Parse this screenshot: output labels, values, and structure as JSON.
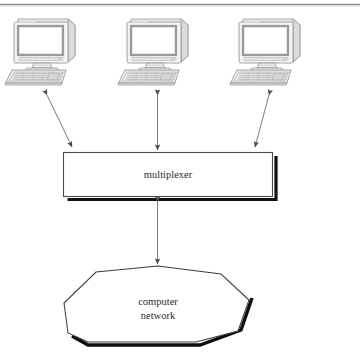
{
  "figure": {
    "type": "network-topology-diagram",
    "title": "",
    "top_rule": true,
    "background_color": "#ffffff",
    "line_color": "#3a3a3a",
    "shadow_color": "#000000",
    "text_color": "#2b2b2b",
    "device_fill": "#ffffff",
    "device_shade": "#d8d8d8"
  },
  "nodes": {
    "terminals": [
      {
        "id": "terminal-1",
        "label": "",
        "icon": "desktop-computer-icon",
        "x": 45,
        "y": 55
      },
      {
        "id": "terminal-2",
        "label": "",
        "icon": "desktop-computer-icon",
        "x": 158,
        "y": 55
      },
      {
        "id": "terminal-3",
        "label": "",
        "icon": "desktop-computer-icon",
        "x": 270,
        "y": 55
      }
    ],
    "multiplexer": {
      "id": "multiplexer-box",
      "label": "multiplexer",
      "shape": "rectangle",
      "shadow": true
    },
    "network": {
      "id": "network-cloud",
      "label_line1": "computer",
      "label_line2": "network",
      "shape": "octagon",
      "shadow": true
    }
  },
  "connections": [
    {
      "id": "link-terminal1-mux",
      "from": "terminal-1",
      "to": "multiplexer-box",
      "style": "double-arrow"
    },
    {
      "id": "link-terminal2-mux",
      "from": "terminal-2",
      "to": "multiplexer-box",
      "style": "double-arrow"
    },
    {
      "id": "link-terminal3-mux",
      "from": "terminal-3",
      "to": "multiplexer-box",
      "style": "double-arrow"
    },
    {
      "id": "link-mux-network",
      "from": "multiplexer-box",
      "to": "network-cloud",
      "style": "double-arrow"
    }
  ]
}
